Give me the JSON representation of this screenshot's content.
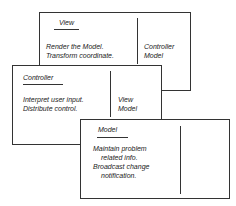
{
  "diagram": {
    "type": "CRC cards (Model-View-Controller)",
    "cards": [
      {
        "class_name": "View",
        "responsibilities": [
          "Render the Model.",
          "Transform coordinate."
        ],
        "collaborators": [
          "Controller",
          "Model"
        ]
      },
      {
        "class_name": "Controller",
        "responsibilities": [
          "Interpret user input.",
          "Distribute control."
        ],
        "collaborators": [
          "View",
          "Model"
        ]
      },
      {
        "class_name": "Model",
        "responsibilities": [
          "Maintain problem",
          "related info.",
          "Broadcast change",
          "notification."
        ],
        "collaborators": []
      }
    ]
  }
}
